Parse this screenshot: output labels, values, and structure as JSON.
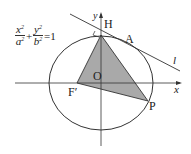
{
  "diagram": {
    "type": "ellipse-tangent-triangle",
    "equation": {
      "term1_num": "x",
      "term1_den": "a",
      "term2_num": "y",
      "term2_den": "b",
      "exp": "2",
      "plus": "+",
      "rhs": "=1"
    },
    "labels": {
      "y_axis": "y",
      "x_axis": "x",
      "H": "H",
      "A": "A",
      "l": "l",
      "O": "O",
      "F_prime": "F′",
      "P": "P"
    },
    "colors": {
      "line": "#333333",
      "fill": "#a9a9a9"
    }
  }
}
